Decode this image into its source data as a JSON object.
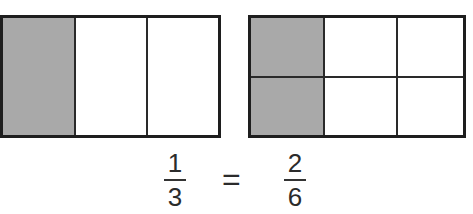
{
  "diagram": {
    "left_rectangle": {
      "rows": 1,
      "columns": 3,
      "shaded_cells": 1,
      "cells": [
        {
          "row": 0,
          "col": 0,
          "shaded": true
        },
        {
          "row": 0,
          "col": 1,
          "shaded": false
        },
        {
          "row": 0,
          "col": 2,
          "shaded": false
        }
      ]
    },
    "right_rectangle": {
      "rows": 2,
      "columns": 3,
      "shaded_cells": 2,
      "cells": [
        {
          "row": 0,
          "col": 0,
          "shaded": true
        },
        {
          "row": 0,
          "col": 1,
          "shaded": false
        },
        {
          "row": 0,
          "col": 2,
          "shaded": false
        },
        {
          "row": 1,
          "col": 0,
          "shaded": true
        },
        {
          "row": 1,
          "col": 1,
          "shaded": false
        },
        {
          "row": 1,
          "col": 2,
          "shaded": false
        }
      ]
    },
    "equation": {
      "left_fraction": {
        "numerator": "1",
        "denominator": "3"
      },
      "operator": "=",
      "right_fraction": {
        "numerator": "2",
        "denominator": "6"
      }
    },
    "colors": {
      "shaded": "#a9a9a9",
      "unshaded": "#ffffff",
      "outline": "#1e1e1e"
    }
  }
}
